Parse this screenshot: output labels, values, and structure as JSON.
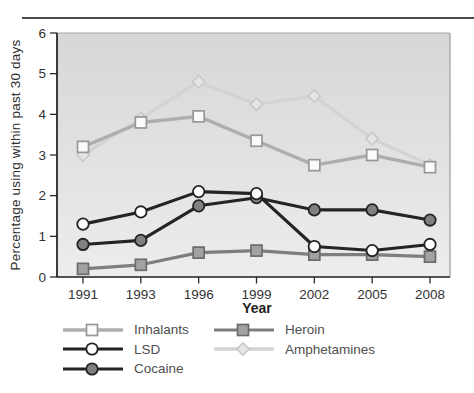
{
  "figure": {
    "top_rule_color": "#4d4d4d"
  },
  "chart_data": {
    "type": "line",
    "title": "",
    "xlabel": "Year",
    "ylabel": "Percentage using within past 30 days",
    "x_axis": {
      "categories": [
        "1991",
        "1993",
        "1996",
        "1999",
        "2002",
        "2005",
        "2008"
      ]
    },
    "y_axis": {
      "min": 0,
      "max": 6,
      "ticks": [
        0,
        1,
        2,
        3,
        4,
        5,
        6
      ]
    },
    "grid": "off",
    "plot_background": {
      "gradient_top": "#d5d8d7",
      "gradient_bottom": "#ecedec"
    },
    "series": [
      {
        "name": "Inhalants",
        "values": [
          3.2,
          3.8,
          3.95,
          3.35,
          2.75,
          3.0,
          2.7
        ],
        "line_color": "#aeaeae",
        "marker": "square",
        "marker_fill": "#fbfbfb",
        "marker_stroke": "#979797"
      },
      {
        "name": "LSD",
        "values": [
          1.3,
          1.6,
          2.1,
          2.05,
          0.75,
          0.65,
          0.8
        ],
        "line_color": "#242424",
        "marker": "circle",
        "marker_fill": "#ffffff",
        "marker_stroke": "#242424"
      },
      {
        "name": "Cocaine",
        "values": [
          0.8,
          0.9,
          1.75,
          1.95,
          1.65,
          1.65,
          1.4
        ],
        "line_color": "#242424",
        "marker": "circle",
        "marker_fill": "#808080",
        "marker_stroke": "#242424"
      },
      {
        "name": "Heroin",
        "values": [
          0.2,
          0.3,
          0.6,
          0.65,
          0.55,
          0.55,
          0.5
        ],
        "line_color": "#7e7e7e",
        "marker": "square",
        "marker_fill": "#a2a2a2",
        "marker_stroke": "#6b6b6b"
      },
      {
        "name": "Amphetamines",
        "values": [
          3.0,
          3.9,
          4.8,
          4.25,
          4.45,
          3.4,
          2.75
        ],
        "line_color": "#d3d3d2",
        "marker": "diamond",
        "marker_fill": "#e4e4e3",
        "marker_stroke": "#c4c6c5"
      }
    ],
    "draw_order": [
      "Amphetamines",
      "Inhalants",
      "Heroin",
      "Cocaine",
      "LSD"
    ],
    "legend": {
      "position": "bottom-left",
      "columns": [
        [
          "Inhalants",
          "LSD",
          "Cocaine"
        ],
        [
          "Heroin",
          "Amphetamines"
        ]
      ]
    }
  }
}
